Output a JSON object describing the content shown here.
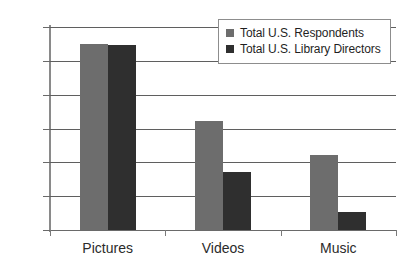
{
  "chart_data": {
    "type": "bar",
    "title": "",
    "subtitle": "",
    "xlabel": "",
    "ylabel": "",
    "categories": [
      "Pictures",
      "Videos",
      "Music"
    ],
    "series": [
      {
        "name": "Total U.S. Respondents",
        "color": "#6d6d6d",
        "values": [
          55.0,
          32.2,
          22.2
        ]
      },
      {
        "name": "Total U.S. Library Directors",
        "color": "#2f2f2f",
        "values": [
          54.7,
          17.1,
          5.4
        ]
      }
    ],
    "ylim": [
      0,
      60
    ],
    "yticks": [
      0,
      10,
      20,
      30,
      40,
      50,
      60
    ],
    "ytick_labels": [
      "0%",
      "10%",
      "20%",
      "30%",
      "40%",
      "50%",
      "60%"
    ],
    "grid": true,
    "grid_axis": "y",
    "legend_position": "top-right",
    "legend_entries": [
      "Total U.S. Respondents",
      "Total U.S. Library Directors"
    ],
    "annotations": []
  },
  "legend": {
    "items": [
      {
        "label": "Total U.S. Respondents",
        "swatch": "legend-swatch-gray"
      },
      {
        "label": "Total U.S. Library Directors",
        "swatch": "legend-swatch-dark"
      }
    ]
  },
  "colors": {
    "series_0": "#6d6d6d",
    "series_1": "#2f2f2f",
    "gridline": "#5f5f5f",
    "axis": "#8a8a8a",
    "text": "#2b2b2b",
    "background": "#ffffff"
  }
}
